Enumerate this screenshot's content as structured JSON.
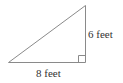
{
  "diagram": {
    "type": "right-triangle",
    "labels": {
      "base": "8 feet",
      "height": "6 feet"
    },
    "right_angle_marker": true,
    "colors": {
      "stroke": "#8a8a8a",
      "text": "#333333",
      "background": "#ffffff"
    }
  }
}
